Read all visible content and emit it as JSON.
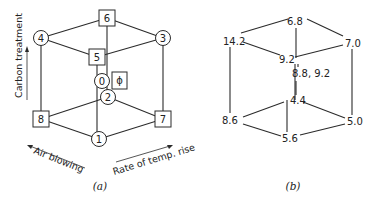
{
  "panel_a": {
    "caption": "(a)",
    "nodes": {
      "n6": "6",
      "n4": "4",
      "n3": "3",
      "n5": "5",
      "n0": "0",
      "n_phi": "ϕ",
      "n2": "2",
      "n8": "8",
      "n7": "7",
      "n1": "1"
    },
    "axes": {
      "vertical": "Carbon treatment",
      "left": "Air blowing",
      "right": "Rate of temp. rise"
    }
  },
  "panel_b": {
    "caption": "(b)",
    "values": {
      "v6": "6.8",
      "v4": "14.2",
      "v3": "7.0",
      "v5": "9.2",
      "v0": "8.8, 9.2",
      "v2": "4.4",
      "v8": "8.6",
      "v7": "5.0",
      "v1": "5.6"
    }
  },
  "colors": {
    "line": "#2b2b2b",
    "text": "#222222",
    "background": "#ffffff"
  }
}
